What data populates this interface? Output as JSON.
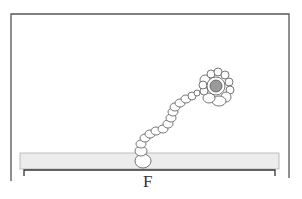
{
  "figure": {
    "label": "F",
    "frame": {
      "left": 11,
      "top": 14,
      "right": 289,
      "bottom_left": 181,
      "bottom_right": 178,
      "color": "#555555"
    },
    "substrate": {
      "x": 20,
      "y": 153,
      "width": 259,
      "height": 16,
      "fill": "#ececec",
      "stroke": "#aaaaaa"
    },
    "bracket": {
      "x1": 24,
      "x2": 275,
      "y": 170,
      "tick_bottom": 176,
      "color": "#333333"
    },
    "cluster": {
      "cx": 216,
      "cy": 86,
      "nucleus_r": 6,
      "nucleus_fill": "#9a9a9a"
    },
    "chain_cells": [
      [
        143,
        161,
        8,
        7
      ],
      [
        141,
        151,
        6,
        5
      ],
      [
        141,
        144,
        5,
        4
      ],
      [
        145,
        138,
        5,
        4
      ],
      [
        150,
        134,
        5,
        4
      ],
      [
        156,
        131,
        5,
        4
      ],
      [
        163,
        129,
        5,
        4
      ],
      [
        168,
        124,
        5,
        4
      ],
      [
        171,
        118,
        5,
        4
      ],
      [
        173,
        112,
        5,
        4
      ],
      [
        175,
        107,
        5,
        4
      ],
      [
        180,
        103,
        5,
        4
      ],
      [
        186,
        99,
        5,
        4
      ],
      [
        192,
        96,
        4,
        4
      ],
      [
        197,
        93,
        3,
        3
      ]
    ],
    "cluster_cells": [
      [
        205,
        80,
        5,
        5
      ],
      [
        211,
        74,
        4,
        4
      ],
      [
        218,
        72,
        4,
        4
      ],
      [
        225,
        75,
        4,
        4
      ],
      [
        229,
        82,
        4,
        4
      ],
      [
        230,
        90,
        4,
        4
      ],
      [
        226,
        97,
        5,
        5
      ],
      [
        219,
        101,
        7,
        5
      ],
      [
        209,
        98,
        6,
        5
      ],
      [
        204,
        91,
        4,
        4
      ],
      [
        203,
        85,
        4,
        4
      ]
    ]
  }
}
